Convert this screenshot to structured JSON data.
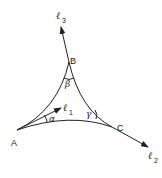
{
  "diagram": {
    "type": "geodesic triangle with tangent vectors",
    "vertices": [
      {
        "id": "A",
        "label": "A"
      },
      {
        "id": "B",
        "label": "B"
      },
      {
        "id": "C",
        "label": "C"
      }
    ],
    "angles": [
      {
        "vertex": "A",
        "label": "α"
      },
      {
        "vertex": "B",
        "label": "β"
      },
      {
        "vertex": "C",
        "label": "γ"
      }
    ],
    "vectors": [
      {
        "name": "l1",
        "symbol": "ℓ",
        "subscript": "1"
      },
      {
        "name": "l2",
        "symbol": "ℓ",
        "subscript": "2"
      },
      {
        "name": "l3",
        "symbol": "ℓ",
        "subscript": "3"
      }
    ],
    "colors": {
      "stroke": "#222222",
      "background": "#ffffff"
    }
  }
}
